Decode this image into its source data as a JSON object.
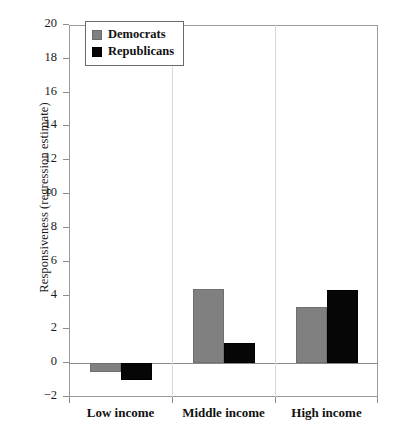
{
  "chart_data": {
    "type": "bar",
    "title": "",
    "subtitle": "",
    "xlabel": "",
    "ylabel": "Responsiveness (regression estimate)",
    "categories": [
      "Low income",
      "Middle income",
      "High income"
    ],
    "series": [
      {
        "name": "Democrats",
        "color": "#808080",
        "values": [
          -0.5,
          4.4,
          3.3
        ]
      },
      {
        "name": "Republicans",
        "color": "#000000",
        "values": [
          -1.0,
          1.2,
          4.3
        ]
      }
    ],
    "ylim": [
      -2,
      20
    ],
    "ytick_step": 2,
    "ytick_labels": [
      "20",
      "18",
      "16",
      "14",
      "12",
      "10",
      "8",
      "6",
      "4",
      "2",
      "0",
      "−2"
    ],
    "ytick_values": [
      20,
      18,
      16,
      14,
      12,
      10,
      8,
      6,
      4,
      2,
      0,
      -2
    ],
    "grid": false,
    "legend_position": "top-left",
    "zero_line": true
  },
  "legend": {
    "entries": [
      {
        "label": "Democrats",
        "swatch": "gray-square-icon"
      },
      {
        "label": "Republicans",
        "swatch": "black-square-icon"
      }
    ]
  },
  "axes": {
    "y_title": "Responsiveness (regression estimate)"
  }
}
